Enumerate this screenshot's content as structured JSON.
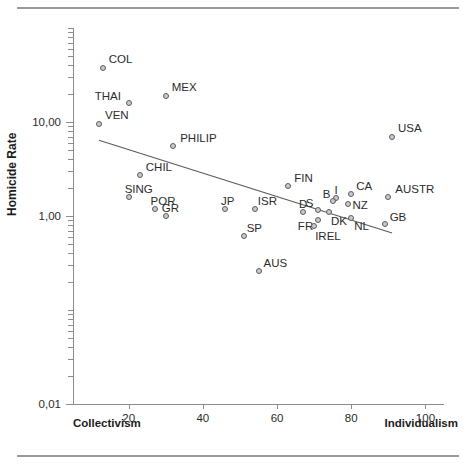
{
  "figure": {
    "y_axis_title": "Homicide Rate",
    "left_corner_label": "Collectivism",
    "right_corner_label": "Individualism"
  },
  "chart_data": {
    "type": "scatter",
    "title": "",
    "xlabel": "",
    "ylabel": "Homicide Rate",
    "xlim": [
      5,
      105
    ],
    "ylim": [
      0.01,
      100
    ],
    "yscale": "log",
    "xscale": "linear",
    "grid": false,
    "legend": "none",
    "x_ticks": [
      "20",
      "40",
      "60",
      "80",
      "100"
    ],
    "x_tick_values": [
      20,
      40,
      60,
      80,
      100
    ],
    "y_ticks": [
      "10,00",
      "1,00",
      "0,01"
    ],
    "y_tick_values": [
      10,
      1,
      0.01
    ],
    "x_axis_endpoints": [
      "Collectivism",
      "Individualism"
    ],
    "points": [
      {
        "label": "COL",
        "x": 13,
        "y": 38.0
      },
      {
        "label": "MEX",
        "x": 30,
        "y": 19.0
      },
      {
        "label": "THAI",
        "x": 20,
        "y": 16.0
      },
      {
        "label": "VEN",
        "x": 12,
        "y": 9.6
      },
      {
        "label": "USA",
        "x": 91,
        "y": 7.0
      },
      {
        "label": "PHILIP",
        "x": 32,
        "y": 5.5
      },
      {
        "label": "CHIL",
        "x": 23,
        "y": 2.7
      },
      {
        "label": "FIN",
        "x": 63,
        "y": 2.1
      },
      {
        "label": "SING",
        "x": 20,
        "y": 1.6
      },
      {
        "label": "CA",
        "x": 80,
        "y": 1.7
      },
      {
        "label": "AUSTR",
        "x": 90,
        "y": 1.6
      },
      {
        "label": "I",
        "x": 76,
        "y": 1.55
      },
      {
        "label": "B",
        "x": 75,
        "y": 1.45
      },
      {
        "label": "NZ",
        "x": 79,
        "y": 1.35
      },
      {
        "label": "POR",
        "x": 27,
        "y": 1.2
      },
      {
        "label": "JP",
        "x": 46,
        "y": 1.2
      },
      {
        "label": "ISR",
        "x": 54,
        "y": 1.2
      },
      {
        "label": "S",
        "x": 71,
        "y": 1.15
      },
      {
        "label": "D",
        "x": 67,
        "y": 1.1
      },
      {
        "label": "DK",
        "x": 74,
        "y": 1.1
      },
      {
        "label": "GR",
        "x": 30,
        "y": 1.0
      },
      {
        "label": "NL",
        "x": 80,
        "y": 0.95
      },
      {
        "label": "FR",
        "x": 71,
        "y": 0.9
      },
      {
        "label": "IREL",
        "x": 70,
        "y": 0.78
      },
      {
        "label": "GB",
        "x": 89,
        "y": 0.83
      },
      {
        "label": "SP",
        "x": 51,
        "y": 0.62
      },
      {
        "label": "AUS",
        "x": 55,
        "y": 0.26
      }
    ],
    "trend_line": {
      "type": "linear-fit-on-log-y",
      "x_start": 12,
      "y_start": 6.4,
      "x_end": 91,
      "y_end": 0.66,
      "slope_direction": "negative"
    },
    "annotations": [
      "Point labels are country/region abbreviations placed adjacent to each marker."
    ]
  },
  "marker_style": {
    "fill": "#c9c9c9",
    "edge": "#5c5c5c",
    "shape": "circle"
  },
  "line_style": {
    "color": "#5a5a5a"
  }
}
